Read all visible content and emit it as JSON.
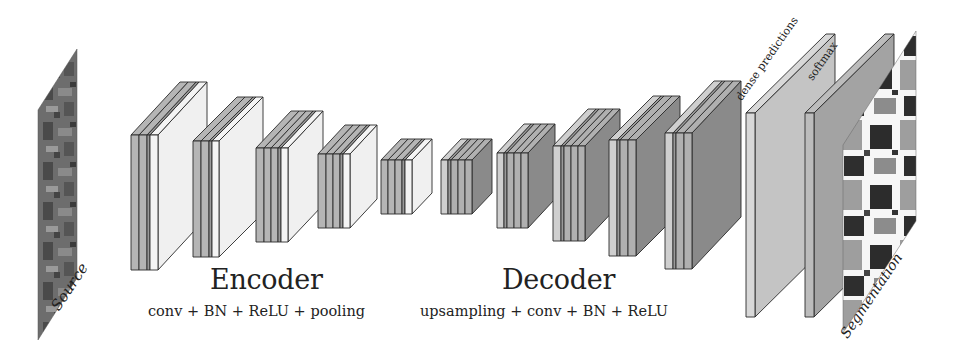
{
  "diagram": {
    "type": "encoder-decoder segmentation network (SegNet-style)",
    "input_label": "Source",
    "output_label": "Segmentation",
    "encoder": {
      "title": "Encoder",
      "subtitle": "conv + BN + ReLU + pooling",
      "blocks": [
        {
          "name": "enc1",
          "x": 131,
          "top": 135,
          "bottom": 270,
          "dx": 49,
          "dy": 53,
          "slabs": [
            {
              "w": 8,
              "c": "#b5b5b5"
            },
            {
              "w": 8,
              "c": "#b5b5b5"
            },
            {
              "w": 3,
              "c": "#9a9a9a"
            },
            {
              "w": 8,
              "c": "#f4f4f4"
            }
          ],
          "face": "#f0f0f0"
        },
        {
          "name": "enc2",
          "x": 193,
          "top": 141,
          "bottom": 257,
          "dx": 44,
          "dy": 44,
          "slabs": [
            {
              "w": 8,
              "c": "#b5b5b5"
            },
            {
              "w": 8,
              "c": "#b5b5b5"
            },
            {
              "w": 3,
              "c": "#9a9a9a"
            },
            {
              "w": 7,
              "c": "#f4f4f4"
            }
          ],
          "face": "#f0f0f0"
        },
        {
          "name": "enc3",
          "x": 256,
          "top": 148,
          "bottom": 242,
          "dx": 35,
          "dy": 37,
          "slabs": [
            {
              "w": 8,
              "c": "#b5b5b5"
            },
            {
              "w": 7,
              "c": "#b5b5b5"
            },
            {
              "w": 7,
              "c": "#b5b5b5"
            },
            {
              "w": 3,
              "c": "#9a9a9a"
            },
            {
              "w": 7,
              "c": "#f4f4f4"
            }
          ],
          "face": "#f0f0f0"
        },
        {
          "name": "enc4",
          "x": 318,
          "top": 154,
          "bottom": 228,
          "dx": 27,
          "dy": 29,
          "slabs": [
            {
              "w": 8,
              "c": "#b5b5b5"
            },
            {
              "w": 7,
              "c": "#b5b5b5"
            },
            {
              "w": 7,
              "c": "#b5b5b5"
            },
            {
              "w": 3,
              "c": "#9a9a9a"
            },
            {
              "w": 7,
              "c": "#f4f4f4"
            }
          ],
          "face": "#f0f0f0"
        },
        {
          "name": "enc5",
          "x": 381,
          "top": 160,
          "bottom": 214,
          "dx": 20,
          "dy": 21,
          "slabs": [
            {
              "w": 7,
              "c": "#b5b5b5"
            },
            {
              "w": 7,
              "c": "#b5b5b5"
            },
            {
              "w": 7,
              "c": "#b5b5b5"
            },
            {
              "w": 3,
              "c": "#9a9a9a"
            },
            {
              "w": 7,
              "c": "#f4f4f4"
            }
          ],
          "face": "#f0f0f0"
        }
      ]
    },
    "decoder": {
      "title": "Decoder",
      "subtitle": "upsampling + conv + BN + ReLU",
      "blocks": [
        {
          "name": "dec1",
          "x": 441,
          "top": 160,
          "bottom": 214,
          "dx": 20,
          "dy": 21,
          "slabs": [
            {
              "w": 7,
              "c": "#cfcfcf"
            },
            {
              "w": 3,
              "c": "#9a9a9a"
            },
            {
              "w": 7,
              "c": "#b0b0b0"
            },
            {
              "w": 7,
              "c": "#b0b0b0"
            },
            {
              "w": 7,
              "c": "#b0b0b0"
            }
          ],
          "face": "#8a8a8a"
        },
        {
          "name": "dec2",
          "x": 497,
          "top": 153,
          "bottom": 228,
          "dx": 27,
          "dy": 29,
          "slabs": [
            {
              "w": 7,
              "c": "#cfcfcf"
            },
            {
              "w": 3,
              "c": "#9a9a9a"
            },
            {
              "w": 7,
              "c": "#b0b0b0"
            },
            {
              "w": 7,
              "c": "#b0b0b0"
            },
            {
              "w": 7,
              "c": "#b0b0b0"
            }
          ],
          "face": "#8a8a8a"
        },
        {
          "name": "dec3",
          "x": 553,
          "top": 146,
          "bottom": 241,
          "dx": 35,
          "dy": 37,
          "slabs": [
            {
              "w": 8,
              "c": "#cfcfcf"
            },
            {
              "w": 3,
              "c": "#9a9a9a"
            },
            {
              "w": 7,
              "c": "#b0b0b0"
            },
            {
              "w": 7,
              "c": "#b0b0b0"
            },
            {
              "w": 7,
              "c": "#b0b0b0"
            }
          ],
          "face": "#8a8a8a"
        },
        {
          "name": "dec4",
          "x": 609,
          "top": 140,
          "bottom": 256,
          "dx": 44,
          "dy": 44,
          "slabs": [
            {
              "w": 8,
              "c": "#cfcfcf"
            },
            {
              "w": 3,
              "c": "#9a9a9a"
            },
            {
              "w": 8,
              "c": "#b0b0b0"
            },
            {
              "w": 8,
              "c": "#b0b0b0"
            }
          ],
          "face": "#8a8a8a"
        },
        {
          "name": "dec5",
          "x": 665,
          "top": 133,
          "bottom": 269,
          "dx": 49,
          "dy": 52,
          "slabs": [
            {
              "w": 8,
              "c": "#cfcfcf"
            },
            {
              "w": 3,
              "c": "#9a9a9a"
            },
            {
              "w": 8,
              "c": "#b0b0b0"
            },
            {
              "w": 8,
              "c": "#b0b0b0"
            }
          ],
          "face": "#8a8a8a"
        }
      ]
    },
    "outputs": [
      {
        "name": "dense-predictions",
        "label": "dense predictions",
        "x": 746,
        "top": 113,
        "bottom": 317,
        "dx": 80,
        "dy": 79,
        "slabs": [
          {
            "w": 9,
            "c": "#d8d8d8"
          }
        ],
        "face": "#c4c4c4"
      },
      {
        "name": "softmax",
        "label": "softmax",
        "x": 805,
        "top": 113,
        "bottom": 317,
        "dx": 80,
        "dy": 79,
        "slabs": [
          {
            "w": 9,
            "c": "#bcbcbc"
          }
        ],
        "face": "#a3a3a3"
      }
    ],
    "colors": {
      "stroke": "#2a2a2a",
      "encoder_front": "#b5b5b5",
      "encoder_face": "#f0f0f0",
      "decoder_front": "#b0b0b0",
      "decoder_face": "#8a8a8a",
      "background": "#ffffff"
    }
  }
}
